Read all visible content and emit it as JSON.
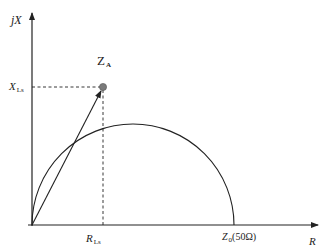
{
  "diagram": {
    "type": "impedance-plane",
    "axes": {
      "y_label": "jX",
      "x_label": "R"
    },
    "point": {
      "name": "Z",
      "subscript": "A"
    },
    "reactance_marker": {
      "name": "X",
      "subscript": "Ls"
    },
    "resistance_marker": {
      "name": "R",
      "subscript": "Ls"
    },
    "semicircle_end": {
      "name": "Z",
      "subscript": "0",
      "value": "(50Ω)"
    },
    "colors": {
      "line": "#222222",
      "point": "#777777"
    }
  }
}
